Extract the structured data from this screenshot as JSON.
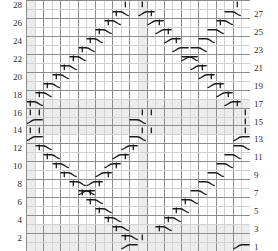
{
  "chart_data": {
    "type": "table",
    "title": "",
    "subtitle": "",
    "xlabel": "",
    "ylabel": "",
    "grid": {
      "columns": 26,
      "rows": 28,
      "show_grid": true
    },
    "axis": {
      "row_numbers_left": [
        28,
        26,
        24,
        22,
        20,
        18,
        16,
        14,
        12,
        10,
        8,
        6,
        4,
        2
      ],
      "row_numbers_right": [
        27,
        25,
        23,
        21,
        19,
        17,
        15,
        13,
        11,
        9,
        7,
        5,
        3,
        1
      ],
      "left_label_side": "even",
      "right_label_side": "odd"
    },
    "legend": [],
    "colors": {
      "grid_minor": "#d2d2d2",
      "grid_major": "#8e8e8e",
      "shade": "#ececec",
      "symbol": "#1a1a1a",
      "label": "#2b2b2b",
      "background": "#ffffff"
    },
    "shaded_columns": [
      1,
      14
    ],
    "shaded_rows": [
      1,
      2,
      3,
      14,
      15,
      16,
      17
    ],
    "symbols": [
      {
        "name": "bar",
        "row": 28,
        "col": 12
      },
      {
        "name": "bar",
        "row": 28,
        "col": 14
      },
      {
        "name": "bar",
        "row": 28,
        "col": 25
      },
      {
        "name": "bar",
        "row": 28,
        "col": 27
      },
      {
        "name": "cable-left",
        "row": 27,
        "col": 11
      },
      {
        "name": "cable-right",
        "row": 27,
        "col": 14
      },
      {
        "name": "bar",
        "row": 27,
        "col": 11
      },
      {
        "name": "bar",
        "row": 27,
        "col": 15
      },
      {
        "name": "cable-left",
        "row": 27,
        "col": 24
      },
      {
        "name": "cable-right",
        "row": 27,
        "col": 27
      },
      {
        "name": "cable-left",
        "row": 26,
        "col": 10
      },
      {
        "name": "bar",
        "row": 26,
        "col": 10
      },
      {
        "name": "cable-right",
        "row": 26,
        "col": 15
      },
      {
        "name": "bar",
        "row": 26,
        "col": 16
      },
      {
        "name": "cable-left",
        "row": 26,
        "col": 23
      },
      {
        "name": "bar",
        "row": 26,
        "col": 23
      },
      {
        "name": "cable-left",
        "row": 25,
        "col": 9
      },
      {
        "name": "bar",
        "row": 25,
        "col": 9
      },
      {
        "name": "cable-right",
        "row": 25,
        "col": 16
      },
      {
        "name": "bar",
        "row": 25,
        "col": 17
      },
      {
        "name": "cable-left",
        "row": 25,
        "col": 22
      },
      {
        "name": "cable-left",
        "row": 24,
        "col": 8
      },
      {
        "name": "bar",
        "row": 24,
        "col": 8
      },
      {
        "name": "cable-right",
        "row": 24,
        "col": 17
      },
      {
        "name": "bar",
        "row": 24,
        "col": 18
      },
      {
        "name": "cable-left",
        "row": 24,
        "col": 21
      },
      {
        "name": "cable-left",
        "row": 23,
        "col": 7
      },
      {
        "name": "bar",
        "row": 23,
        "col": 7
      },
      {
        "name": "cable-right",
        "row": 23,
        "col": 18
      },
      {
        "name": "cable-left",
        "row": 23,
        "col": 20
      },
      {
        "name": "cable-left",
        "row": 22,
        "col": 6
      },
      {
        "name": "bar",
        "row": 22,
        "col": 6
      },
      {
        "name": "cable-right",
        "row": 22,
        "col": 19
      },
      {
        "name": "cable-left",
        "row": 22,
        "col": 19
      },
      {
        "name": "cable-left",
        "row": 21,
        "col": 5
      },
      {
        "name": "bar",
        "row": 21,
        "col": 5
      },
      {
        "name": "cable-right",
        "row": 21,
        "col": 20
      },
      {
        "name": "bar",
        "row": 21,
        "col": 21
      },
      {
        "name": "cable-left",
        "row": 20,
        "col": 4
      },
      {
        "name": "bar",
        "row": 20,
        "col": 4
      },
      {
        "name": "cable-right",
        "row": 20,
        "col": 21
      },
      {
        "name": "bar",
        "row": 20,
        "col": 22
      },
      {
        "name": "cable-left",
        "row": 19,
        "col": 3
      },
      {
        "name": "bar",
        "row": 19,
        "col": 3
      },
      {
        "name": "cable-right",
        "row": 19,
        "col": 22
      },
      {
        "name": "bar",
        "row": 19,
        "col": 23
      },
      {
        "name": "cable-left",
        "row": 18,
        "col": 2
      },
      {
        "name": "bar",
        "row": 18,
        "col": 2
      },
      {
        "name": "cable-right",
        "row": 18,
        "col": 23
      },
      {
        "name": "bar",
        "row": 18,
        "col": 24
      },
      {
        "name": "cable-left",
        "row": 17,
        "col": 1
      },
      {
        "name": "bar",
        "row": 17,
        "col": 1
      },
      {
        "name": "cable-right",
        "row": 17,
        "col": 24
      },
      {
        "name": "bar",
        "row": 17,
        "col": 25
      },
      {
        "name": "bar",
        "row": 16,
        "col": 1
      },
      {
        "name": "bar",
        "row": 16,
        "col": 2
      },
      {
        "name": "bar",
        "row": 16,
        "col": 14
      },
      {
        "name": "bar",
        "row": 16,
        "col": 15
      },
      {
        "name": "bar",
        "row": 16,
        "col": 26
      },
      {
        "name": "cable-right",
        "row": 15,
        "col": 1
      },
      {
        "name": "cable-left",
        "row": 15,
        "col": 13
      },
      {
        "name": "bar",
        "row": 15,
        "col": 26
      },
      {
        "name": "bar",
        "row": 14,
        "col": 1
      },
      {
        "name": "bar",
        "row": 14,
        "col": 2
      },
      {
        "name": "bar",
        "row": 14,
        "col": 14
      },
      {
        "name": "bar",
        "row": 14,
        "col": 15
      },
      {
        "name": "bar",
        "row": 14,
        "col": 26
      },
      {
        "name": "cable-right",
        "row": 13,
        "col": 1
      },
      {
        "name": "cable-left",
        "row": 13,
        "col": 13
      },
      {
        "name": "cable-right",
        "row": 13,
        "col": 25
      },
      {
        "name": "cable-left",
        "row": 12,
        "col": 2
      },
      {
        "name": "bar",
        "row": 12,
        "col": 2
      },
      {
        "name": "cable-right",
        "row": 12,
        "col": 12
      },
      {
        "name": "bar",
        "row": 12,
        "col": 13
      },
      {
        "name": "cable-left",
        "row": 12,
        "col": 25
      },
      {
        "name": "cable-left",
        "row": 11,
        "col": 3
      },
      {
        "name": "bar",
        "row": 11,
        "col": 3
      },
      {
        "name": "cable-right",
        "row": 11,
        "col": 11
      },
      {
        "name": "bar",
        "row": 11,
        "col": 12
      },
      {
        "name": "cable-left",
        "row": 11,
        "col": 24
      },
      {
        "name": "cable-left",
        "row": 10,
        "col": 4
      },
      {
        "name": "bar",
        "row": 10,
        "col": 4
      },
      {
        "name": "cable-right",
        "row": 10,
        "col": 10
      },
      {
        "name": "bar",
        "row": 10,
        "col": 11
      },
      {
        "name": "cable-left",
        "row": 10,
        "col": 23
      },
      {
        "name": "cable-left",
        "row": 9,
        "col": 5
      },
      {
        "name": "bar",
        "row": 9,
        "col": 5
      },
      {
        "name": "cable-right",
        "row": 9,
        "col": 9
      },
      {
        "name": "bar",
        "row": 9,
        "col": 10
      },
      {
        "name": "cable-left",
        "row": 9,
        "col": 22
      },
      {
        "name": "cable-left",
        "row": 8,
        "col": 6
      },
      {
        "name": "bar",
        "row": 8,
        "col": 6
      },
      {
        "name": "cable-right",
        "row": 8,
        "col": 8
      },
      {
        "name": "bar",
        "row": 8,
        "col": 9
      },
      {
        "name": "cable-left",
        "row": 8,
        "col": 21
      },
      {
        "name": "cable-left",
        "row": 7,
        "col": 7
      },
      {
        "name": "bar",
        "row": 7,
        "col": 7
      },
      {
        "name": "cable-right",
        "row": 7,
        "col": 7
      },
      {
        "name": "bar",
        "row": 7,
        "col": 8
      },
      {
        "name": "cable-left",
        "row": 7,
        "col": 20
      },
      {
        "name": "bar",
        "row": 6,
        "col": 8
      },
      {
        "name": "cable-left",
        "row": 6,
        "col": 8
      },
      {
        "name": "bar",
        "row": 6,
        "col": 19
      },
      {
        "name": "cable-left",
        "row": 6,
        "col": 19
      },
      {
        "name": "bar",
        "row": 5,
        "col": 9
      },
      {
        "name": "cable-left",
        "row": 5,
        "col": 9
      },
      {
        "name": "bar",
        "row": 5,
        "col": 18
      },
      {
        "name": "cable-left",
        "row": 5,
        "col": 18
      },
      {
        "name": "bar",
        "row": 4,
        "col": 10
      },
      {
        "name": "cable-left",
        "row": 4,
        "col": 10
      },
      {
        "name": "bar",
        "row": 4,
        "col": 17
      },
      {
        "name": "cable-left",
        "row": 4,
        "col": 17
      },
      {
        "name": "bar",
        "row": 3,
        "col": 11
      },
      {
        "name": "cable-left",
        "row": 3,
        "col": 11
      },
      {
        "name": "bar",
        "row": 3,
        "col": 16
      },
      {
        "name": "cable-left",
        "row": 3,
        "col": 16
      },
      {
        "name": "bar",
        "row": 2,
        "col": 12
      },
      {
        "name": "bar",
        "row": 2,
        "col": 14
      },
      {
        "name": "cable-left",
        "row": 2,
        "col": 12
      },
      {
        "name": "cable-right",
        "row": 1,
        "col": 12
      },
      {
        "name": "cable-right",
        "row": 1,
        "col": 25
      }
    ]
  },
  "meta": {
    "chart_name": "cable-knitting-chart"
  }
}
